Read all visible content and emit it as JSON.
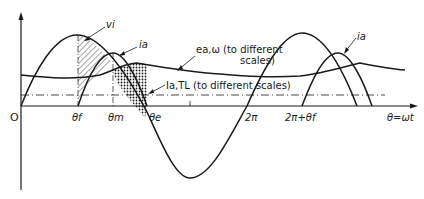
{
  "diagram": {
    "type": "waveform",
    "origin_label": "O",
    "x_axis_label": "θ=ωt",
    "tick_labels": {
      "theta_f": "θf",
      "theta_m": "θm",
      "theta_e": "θe",
      "two_pi": "2π",
      "two_pi_plus_theta_f": "2π+θf"
    },
    "curve_labels": {
      "vi": "vi",
      "ia_first": "ia",
      "ia_second": "ia",
      "ea_omega_line1": "ea,ω (to different",
      "ea_omega_line2": "scales)",
      "ia_tl": "Ia,TL (to different scales)"
    },
    "colors": {
      "stroke": "#1a1a1a",
      "background": "#ffffff"
    }
  }
}
